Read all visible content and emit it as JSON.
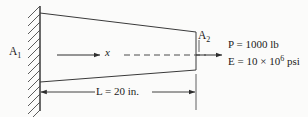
{
  "figure": {
    "type": "engineering-diagram",
    "background_color": "#fbfbfa",
    "line_color": "#3a3a3a"
  },
  "labels": {
    "area_left": "A",
    "area_left_sub": "1",
    "area_right": "A",
    "area_right_sub": "2",
    "axis": "x",
    "length": "L = 20 in.",
    "force_prefix": "P = 1000 lb",
    "modulus_prefix": "E = 10 ",
    "modulus_times": "×",
    "modulus_base": " 10",
    "modulus_exponent": "6",
    "modulus_units": " psi"
  },
  "values": {
    "length_symbol": "L",
    "length_value": "20",
    "length_units": "in.",
    "force_symbol": "P",
    "force_value": "1000",
    "force_units": "lb",
    "modulus_symbol": "E",
    "modulus_value": "10 × 10^6",
    "modulus_units": "psi"
  },
  "geometry": {
    "wall_x": 40,
    "bar_right_x": 196,
    "bar_top_left_y": 13,
    "bar_top_right_y": 32,
    "bar_bottom_left_y": 82,
    "bar_bottom_right_y": 70,
    "centerline_y": 55,
    "dimension_y": 92
  }
}
